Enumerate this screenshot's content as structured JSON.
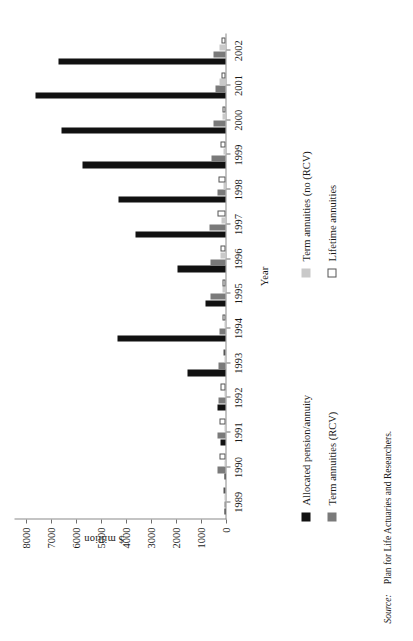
{
  "figure": {
    "source_lead": "Source:",
    "source_text": "Plan for Life Actuaries and Researchers."
  },
  "axes": {
    "xlabel": "Year",
    "ylabel": "$ million"
  },
  "legend": {
    "items": [
      {
        "label": "Allocated pension/annuity",
        "color": "#111111",
        "swatch": "filled-black-swatch"
      },
      {
        "label": "Term annuities (no (RCV)",
        "color": "#c9c9c9",
        "swatch": "filled-lightgray-swatch"
      },
      {
        "label": "Term annuities (RCV)",
        "color": "#7a7a7a",
        "swatch": "filled-darkgray-swatch"
      },
      {
        "label": "Lifetime annuities",
        "color": "#ffffff",
        "swatch": "outlined-white-swatch"
      }
    ]
  },
  "chart_data": {
    "type": "bar",
    "title": "",
    "xlabel": "Year",
    "ylabel": "$ million",
    "ylim": [
      0,
      8500
    ],
    "ytick_labels": [
      "0",
      "1000",
      "2000",
      "3000",
      "4000",
      "5000",
      "6000",
      "7000",
      "8000"
    ],
    "yticks": [
      0,
      1000,
      2000,
      3000,
      4000,
      5000,
      6000,
      7000,
      8000
    ],
    "grid": false,
    "legend_position": "below-left",
    "orientation": "vertical-bars-rotated-90ccw",
    "categories": [
      "1989",
      "1990",
      "1991",
      "1992",
      "1993",
      "1994",
      "1995",
      "1996",
      "1997",
      "1998",
      "1999",
      "2000",
      "2001",
      "2002"
    ],
    "series": [
      {
        "name": "Allocated pension/annuity",
        "color": "#111111",
        "values": [
          30,
          60,
          220,
          340,
          1520,
          4320,
          810,
          1930,
          3620,
          4310,
          5750,
          6580,
          7620,
          6680
        ]
      },
      {
        "name": "Term annuities (RCV)",
        "color": "#7a7a7a",
        "values": [
          40,
          310,
          330,
          300,
          280,
          250,
          600,
          590,
          640,
          330,
          570,
          500,
          420,
          470
        ]
      },
      {
        "name": "Term annuities (no (RCV)",
        "color": "#c9c9c9",
        "values": [
          20,
          40,
          40,
          40,
          30,
          30,
          110,
          190,
          170,
          100,
          90,
          110,
          230,
          260
        ]
      },
      {
        "name": "Lifetime annuities",
        "color": "#ffffff",
        "values": [
          15,
          230,
          230,
          200,
          90,
          120,
          130,
          220,
          330,
          270,
          190,
          140,
          180,
          150
        ]
      }
    ]
  }
}
